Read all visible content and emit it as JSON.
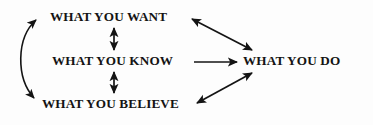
{
  "diagram": {
    "background_color": "#fdfdfd",
    "ink_color": "#141414",
    "nodes": [
      {
        "id": "want",
        "label": "WHAT YOU WANT",
        "position": "top-left"
      },
      {
        "id": "know",
        "label": "WHAT YOU KNOW",
        "position": "middle-left"
      },
      {
        "id": "believe",
        "label": "WHAT YOU BELIEVE",
        "position": "bottom-left"
      },
      {
        "id": "do",
        "label": "WHAT YOU DO",
        "position": "middle-right"
      }
    ],
    "edges": [
      {
        "id": "want-know",
        "from": "want",
        "to": "know",
        "style": "straight-vertical",
        "heads": "double"
      },
      {
        "id": "know-believe",
        "from": "know",
        "to": "believe",
        "style": "straight-vertical",
        "heads": "double"
      },
      {
        "id": "want-believe",
        "from": "want",
        "to": "believe",
        "style": "curved-left-bracket",
        "heads": "double"
      },
      {
        "id": "want-do",
        "from": "want",
        "to": "do",
        "style": "straight-diagonal",
        "heads": "double"
      },
      {
        "id": "believe-do",
        "from": "believe",
        "to": "do",
        "style": "straight-diagonal",
        "heads": "double"
      },
      {
        "id": "know-do",
        "from": "know",
        "to": "do",
        "style": "straight-horizontal",
        "heads": "single"
      }
    ]
  }
}
